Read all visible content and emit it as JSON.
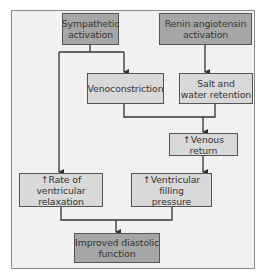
{
  "diagram": {
    "colors": {
      "frame_bg": "#f1f1f1",
      "dark_box": "#a6a6a6",
      "light_box": "#d9d9d9",
      "line": "#333333"
    },
    "nodes": {
      "sympathetic": {
        "line1": "Sympathetic",
        "line2": "activation",
        "style": "dark"
      },
      "renin": {
        "line1": "Renin angiotensin",
        "line2": "activation",
        "style": "dark"
      },
      "venoconstriction": {
        "line1": "Venoconstriction",
        "style": "light"
      },
      "salt_water": {
        "line1": "Salt and",
        "line2": "water retention",
        "style": "light"
      },
      "venous_return": {
        "line1": "↑Venous return",
        "style": "light"
      },
      "rate_relaxation": {
        "line1": "↑Rate of ventricular",
        "line2": "relaxation",
        "style": "light"
      },
      "filling_pressure": {
        "line1": "↑Ventricular filling",
        "line2": "pressure",
        "style": "light"
      },
      "improved": {
        "line1": "Improved diastolic",
        "line2": "function",
        "style": "dark"
      }
    },
    "edges": [
      [
        "sympathetic",
        "venoconstriction"
      ],
      [
        "sympathetic",
        "rate_relaxation"
      ],
      [
        "renin",
        "salt_water"
      ],
      [
        "venoconstriction",
        "venous_return"
      ],
      [
        "salt_water",
        "venous_return"
      ],
      [
        "venous_return",
        "filling_pressure"
      ],
      [
        "rate_relaxation",
        "improved"
      ],
      [
        "filling_pressure",
        "improved"
      ]
    ]
  }
}
